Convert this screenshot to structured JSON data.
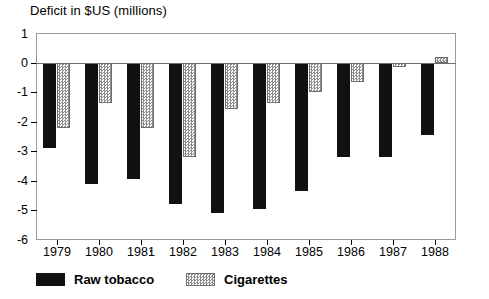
{
  "chart_data": {
    "type": "bar",
    "title": "Deficit in $US (millions)",
    "xlabel": "",
    "ylabel": "Deficit in $US (millions)",
    "ylim": [
      -6,
      1
    ],
    "yticks": [
      1,
      0,
      -1,
      -2,
      -3,
      -4,
      -5,
      -6
    ],
    "ytick_labels": [
      "1",
      "0",
      "-1",
      "-2",
      "-3",
      "-4",
      "-5",
      "-6"
    ],
    "grid": false,
    "legend_position": "bottom",
    "categories": [
      "1979",
      "1980",
      "1981",
      "1982",
      "1983",
      "1984",
      "1985",
      "1986",
      "1987",
      "1988"
    ],
    "series": [
      {
        "name": "Raw tobacco",
        "color": "#111111",
        "pattern": "solid",
        "values": [
          -2.9,
          -4.1,
          -3.95,
          -4.8,
          -5.1,
          -4.95,
          -4.35,
          -3.2,
          -3.2,
          -2.45
        ]
      },
      {
        "name": "Cigarettes",
        "color": "#8d8d8d",
        "pattern": "hatched",
        "values": [
          -2.2,
          -1.35,
          -2.2,
          -3.2,
          -1.55,
          -1.35,
          -1.0,
          -0.65,
          -0.15,
          0.2
        ]
      }
    ],
    "annotations": [
      {
        "name": "stray-dot",
        "x": "between 1981 and 1982",
        "note": "scan artifact dot"
      }
    ]
  },
  "legend": {
    "items": [
      {
        "label": "Raw tobacco",
        "swatch": "solid-black-swatch"
      },
      {
        "label": "Cigarettes",
        "swatch": "hatched-gray-swatch"
      }
    ]
  }
}
